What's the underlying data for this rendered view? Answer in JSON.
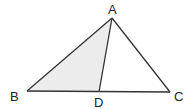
{
  "diagram": {
    "type": "geometry-triangle",
    "points": {
      "A": {
        "label": "A",
        "x": 112,
        "y": 18
      },
      "B": {
        "label": "B",
        "x": 27,
        "y": 91
      },
      "C": {
        "label": "C",
        "x": 170,
        "y": 92
      },
      "D": {
        "label": "D",
        "x": 99,
        "y": 92
      }
    },
    "segments": [
      "AB",
      "AC",
      "BC",
      "AD"
    ],
    "shaded_region": "ABD",
    "colors": {
      "stroke": "#333333",
      "shade": "#eeeeee"
    }
  }
}
